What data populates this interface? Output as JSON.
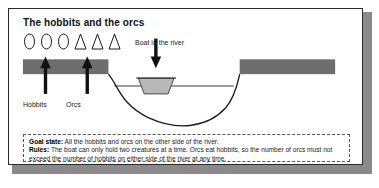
{
  "figure": {
    "title": "The hobbits and the orcs",
    "tokens": [
      {
        "shape": "circle",
        "name": "hobbit-token"
      },
      {
        "shape": "circle",
        "name": "hobbit-token"
      },
      {
        "shape": "circle",
        "name": "hobbit-token"
      },
      {
        "shape": "triangle",
        "name": "orc-token"
      },
      {
        "shape": "triangle",
        "name": "orc-token"
      },
      {
        "shape": "triangle",
        "name": "orc-token"
      }
    ],
    "labels": {
      "hobbits": "Hobbits",
      "orcs": "Orcs",
      "boat": "Boat in the river"
    },
    "callout": {
      "goal_key": "Goal state:",
      "goal_text": "All the hobbits and orcs on the other side of the river.",
      "rules_key": "Rules:",
      "rules_text": "The boat can only hold two creatures at a time. Orcs eat hobbits, so the number of orcs must not exceed the number of hobbits on either side of the river at any time."
    },
    "colors": {
      "bank": "#6e6e6e",
      "boat": "#b8b8b8",
      "outline": "#2b2b2b",
      "shadow": "#8a8a8a",
      "text": "#1a1a1a"
    }
  }
}
